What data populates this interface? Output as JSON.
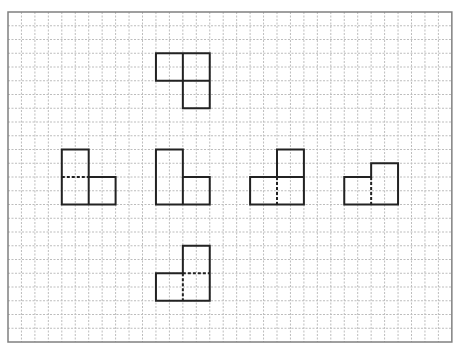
{
  "grid": {
    "origin_x": 8,
    "origin_y": 12,
    "cols": 33,
    "rows": 24,
    "cell_w": 13.45,
    "cell_h": 13.75,
    "border_color": "#808080",
    "grid_color": "#bdbdbd",
    "shape_color": "#222222"
  },
  "shapes": [
    {
      "name": "top-shape",
      "squares": [
        [
          11,
          3
        ],
        [
          13,
          3
        ],
        [
          13,
          5
        ]
      ],
      "outline": [
        [
          11,
          3
        ],
        [
          15,
          3
        ],
        [
          15,
          7
        ],
        [
          13,
          7
        ],
        [
          13,
          5
        ],
        [
          11,
          5
        ]
      ],
      "dividers": [
        {
          "from": [
            13,
            3
          ],
          "to": [
            13,
            5
          ],
          "style": "solid"
        },
        {
          "from": [
            13,
            5
          ],
          "to": [
            15,
            5
          ],
          "style": "solid"
        }
      ]
    },
    {
      "name": "shape-a",
      "outline": [
        [
          4,
          10
        ],
        [
          6,
          10
        ],
        [
          6,
          12
        ],
        [
          8,
          12
        ],
        [
          8,
          14
        ],
        [
          4,
          14
        ]
      ],
      "dividers": [
        {
          "from": [
            4,
            12
          ],
          "to": [
            6,
            12
          ],
          "style": "dashed"
        },
        {
          "from": [
            6,
            12
          ],
          "to": [
            6,
            14
          ],
          "style": "solid"
        }
      ]
    },
    {
      "name": "shape-b",
      "outline": [
        [
          11,
          10
        ],
        [
          13,
          10
        ],
        [
          13,
          12
        ],
        [
          15,
          12
        ],
        [
          15,
          14
        ],
        [
          11,
          14
        ]
      ],
      "dividers": [
        {
          "from": [
            13,
            12
          ],
          "to": [
            13,
            14
          ],
          "style": "solid"
        }
      ]
    },
    {
      "name": "shape-c",
      "outline": [
        [
          20,
          10
        ],
        [
          22,
          10
        ],
        [
          22,
          14
        ],
        [
          18,
          14
        ],
        [
          18,
          12
        ],
        [
          20,
          12
        ]
      ],
      "dividers": [
        {
          "from": [
            20,
            12
          ],
          "to": [
            22,
            12
          ],
          "style": "solid"
        },
        {
          "from": [
            20,
            12
          ],
          "to": [
            20,
            14
          ],
          "style": "dashed"
        }
      ]
    },
    {
      "name": "shape-d",
      "outline": [
        [
          27,
          11
        ],
        [
          29,
          11
        ],
        [
          29,
          14
        ],
        [
          25,
          14
        ],
        [
          25,
          12
        ],
        [
          27,
          12
        ]
      ],
      "dividers": [
        {
          "from": [
            27,
            12
          ],
          "to": [
            27,
            14
          ],
          "style": "dashed"
        }
      ]
    },
    {
      "name": "shape-e",
      "outline": [
        [
          13,
          17
        ],
        [
          15,
          17
        ],
        [
          15,
          21
        ],
        [
          11,
          21
        ],
        [
          11,
          19
        ],
        [
          13,
          19
        ]
      ],
      "dividers": [
        {
          "from": [
            13,
            19
          ],
          "to": [
            15,
            19
          ],
          "style": "dashed"
        },
        {
          "from": [
            13,
            19
          ],
          "to": [
            13,
            21
          ],
          "style": "dashed"
        }
      ]
    }
  ]
}
